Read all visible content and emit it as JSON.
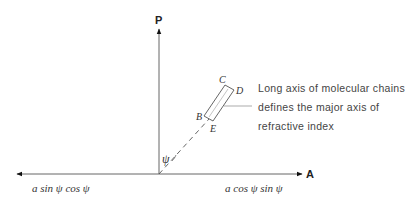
{
  "diagram": {
    "axes": {
      "vertical_label": "P",
      "horizontal_label": "A"
    },
    "angle_label": "ψ",
    "corner_labels": {
      "C": "C",
      "D": "D",
      "B": "B",
      "E": "E"
    },
    "annotation": {
      "lines": [
        "Long axis of molecular chains",
        "defines the major axis of",
        "refractive index"
      ]
    },
    "components": {
      "left": "a sin ψ cos ψ",
      "right": "a cos ψ sin ψ"
    },
    "colors": {
      "line": "#555555",
      "arrowhead": "#111111",
      "text": "#333333"
    }
  }
}
